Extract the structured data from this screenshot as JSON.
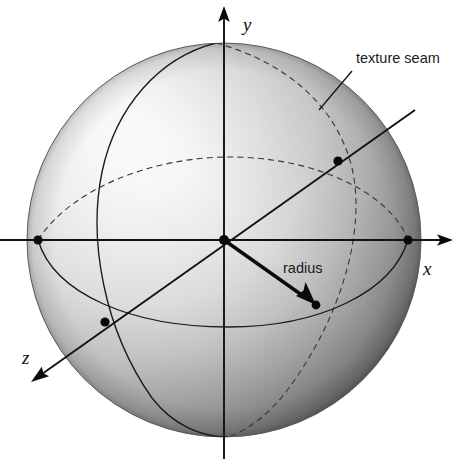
{
  "figure": {
    "background_color": "#ffffff",
    "width": 457,
    "height": 459
  },
  "sphere": {
    "center_x": 224,
    "center_y": 240,
    "radius": 197,
    "shading": "diffuse gray gradient, light source upper-left",
    "highlight_color": "#fdfdfd",
    "mid_color": "#c9c9c9",
    "shadow_color": "#6b6b6b",
    "edge_color": "#4a4a4a"
  },
  "axes": [
    {
      "name": "y-axis",
      "label": "y",
      "direction": "up",
      "label_x": 244,
      "label_y": 30,
      "arrow_tip": [
        224,
        8
      ]
    },
    {
      "name": "x-axis",
      "label": "x",
      "direction": "right",
      "label_x": 428,
      "label_y": 268,
      "arrow_tip": [
        452,
        240
      ]
    },
    {
      "name": "z-axis",
      "label": "z",
      "direction": "lower-left (toward viewer)",
      "label_x": 26,
      "label_y": 358,
      "arrow_tip": [
        33,
        383
      ]
    }
  ],
  "annotations": [
    {
      "name": "texture-seam",
      "label": "texture seam",
      "label_x": 356,
      "label_y": 62,
      "leader_from": [
        352,
        70
      ],
      "leader_to": [
        320,
        109
      ]
    },
    {
      "name": "radius",
      "label": "radius",
      "label_x": 283,
      "label_y": 273,
      "vector_from": [
        224,
        240
      ],
      "vector_to": [
        316,
        305
      ]
    }
  ],
  "markers": [
    {
      "name": "origin-dot",
      "x": 224,
      "y": 240,
      "r": 5.0
    },
    {
      "name": "x-axis-sphere-dot",
      "x": 408,
      "y": 240,
      "r": 4.6
    },
    {
      "name": "negative-x-sphere-dot",
      "x": 38,
      "y": 240,
      "r": 4.6
    },
    {
      "name": "seam-intersection-dot",
      "x": 338,
      "y": 161,
      "r": 4.6
    },
    {
      "name": "z-axis-equator-dot",
      "x": 105,
      "y": 322,
      "r": 4.6
    },
    {
      "name": "radius-endpoint-dot",
      "x": 316,
      "y": 305,
      "r": 4.4
    }
  ],
  "curves": [
    {
      "name": "equator-front",
      "style": "solid",
      "description": "front half of equator ellipse, bulging downward"
    },
    {
      "name": "equator-back",
      "style": "dashed",
      "description": "back half of equator ellipse, bulging upward"
    },
    {
      "name": "seam-meridian-front",
      "style": "solid",
      "description": "front half of texture seam meridian through left of sphere"
    },
    {
      "name": "seam-meridian-back",
      "style": "dashed",
      "description": "back half of texture seam meridian through right of sphere"
    }
  ],
  "colors": {
    "ink": "#111111",
    "dashed_ink": "#3a3a3a",
    "paper": "#ffffff"
  }
}
